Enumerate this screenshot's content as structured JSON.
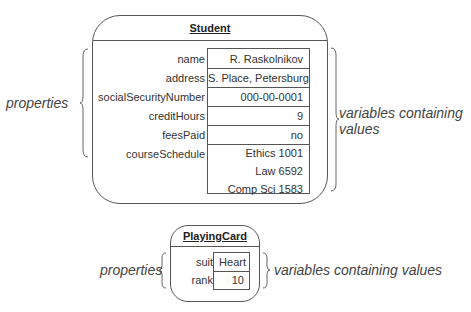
{
  "student": {
    "title": "Student",
    "properties": [
      {
        "name": "name",
        "value": "R. Raskolnikov"
      },
      {
        "name": "address",
        "value": "S. Place, Petersburg"
      },
      {
        "name": "socialSecurityNumber",
        "value": "000-00-0001"
      },
      {
        "name": "creditHours",
        "value": "9"
      },
      {
        "name": "feesPaid",
        "value": "no"
      },
      {
        "name": "courseSchedule",
        "values": [
          "Ethics 1001",
          "Law 6592",
          "Comp Sci 1583"
        ]
      }
    ],
    "left_annotation": "properties",
    "right_annotation_line1": "variables containing",
    "right_annotation_line2": "values"
  },
  "playing_card": {
    "title": "PlayingCard",
    "properties": [
      {
        "name": "suit",
        "value": "Heart"
      },
      {
        "name": "rank",
        "value": "10"
      }
    ],
    "left_annotation": "properties",
    "right_annotation": "variables containing values"
  }
}
